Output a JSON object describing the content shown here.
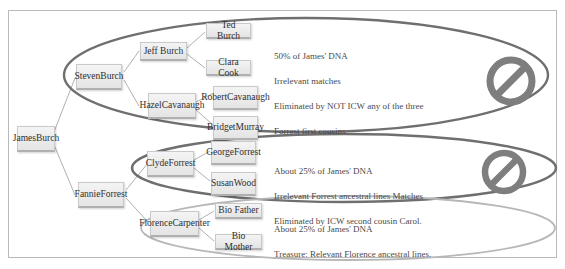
{
  "diagram": {
    "frame_border_color": "#b9b9b9",
    "node_fill_color": "#e9e9e9",
    "dark_ellipse_color": "#6b6b6b",
    "light_ellipse_color": "#b5b5b5",
    "connector_color": "#9a9a9a",
    "prohibition_icon_color": "#7e7e7e"
  },
  "root": {
    "label": "James\nBurch",
    "name": "James Burch"
  },
  "generation2": [
    {
      "label": "Steven\nBurch",
      "name": "Steven Burch"
    },
    {
      "label": "Fannie\nForrest",
      "name": "Fannie Forrest"
    }
  ],
  "clusters": [
    {
      "id": "cluster-top",
      "ellipse_style": "dark",
      "parents": [
        {
          "label": "Jeff Burch"
        },
        {
          "label": "Hazel\nCavanaugh"
        }
      ],
      "leaves": [
        {
          "label": "Ted Burch"
        },
        {
          "label": "Clara Cook"
        },
        {
          "label": "Robert\nCavanaugh"
        },
        {
          "label": "Bridget\nMurray"
        }
      ],
      "note": [
        "50% of James' DNA",
        "Irrelevant matches",
        "Eliminated by NOT ICW any of the three",
        "Forrest first cousins."
      ],
      "status_icon": "prohibition-icon",
      "has_status_icon": true
    },
    {
      "id": "cluster-middle",
      "ellipse_style": "dark",
      "parents": [
        {
          "label": "Clyde\nForrest"
        }
      ],
      "leaves": [
        {
          "label": "George\nForrest"
        },
        {
          "label": "Susan\nWood"
        }
      ],
      "note": [
        "About 25% of James' DNA",
        "Irrelevant Forrest ancestral lines Matches",
        "Eliminated by ICW second cousin Carol."
      ],
      "status_icon": "prohibition-icon",
      "has_status_icon": true
    },
    {
      "id": "cluster-bottom",
      "ellipse_style": "light",
      "parents": [
        {
          "label": "Florence\nCarpenter"
        }
      ],
      "leaves": [
        {
          "label": "Bio Father"
        },
        {
          "label": "Bio Mother"
        }
      ],
      "note": [
        "About 25% of James' DNA",
        "Treasure:  Relevant Florence ancestral lines."
      ],
      "status_icon": null,
      "has_status_icon": false
    }
  ]
}
